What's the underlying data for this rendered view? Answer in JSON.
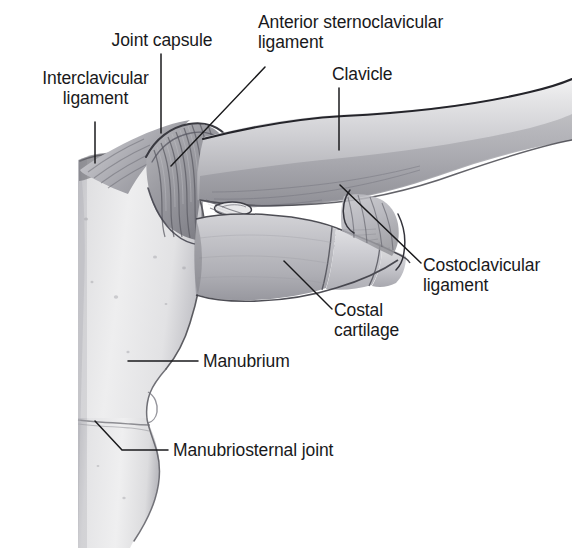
{
  "figure": {
    "style": "grayscale medical illustration",
    "background_color": "#ffffff",
    "line_color": "#1a1a1c",
    "text_color": "#19191b"
  },
  "labels": {
    "interclavicular_ligament": "Interclavicular\nligament",
    "joint_capsule": "Joint capsule",
    "anterior_sternoclavicular_ligament": "Anterior sternoclavicular\nligament",
    "clavicle": "Clavicle",
    "costoclavicular_ligament": "Costoclavicular\nligament",
    "costal_cartilage": "Costal\ncartilage",
    "manubrium": "Manubrium",
    "manubriosternal_joint": "Manubriosternal joint"
  },
  "structures": {
    "clavicle": {
      "name": "Clavicle",
      "tone": "#c9c9cc"
    },
    "manubrium": {
      "name": "Manubrium",
      "tone": "#dcdcde"
    },
    "sternum_body": {
      "name": "Body of sternum",
      "tone": "#dedee0"
    },
    "first_costal_cartilage": {
      "name": "First costal cartilage",
      "tone": "#b4b4b8"
    },
    "capsule_fibers": {
      "name": "Joint capsule fibers",
      "tone": "#9a9a9f"
    },
    "interclavicular_ligament": {
      "name": "Interclavicular ligament",
      "tone": "#8f8f95"
    }
  },
  "colors": {
    "ink": "#1a1a1c",
    "bone_light": "#e6e6e8",
    "bone_mid": "#c6c6ca",
    "bone_dark": "#9a9aa0",
    "shadow": "#6e6e74",
    "paper": "#ffffff"
  }
}
